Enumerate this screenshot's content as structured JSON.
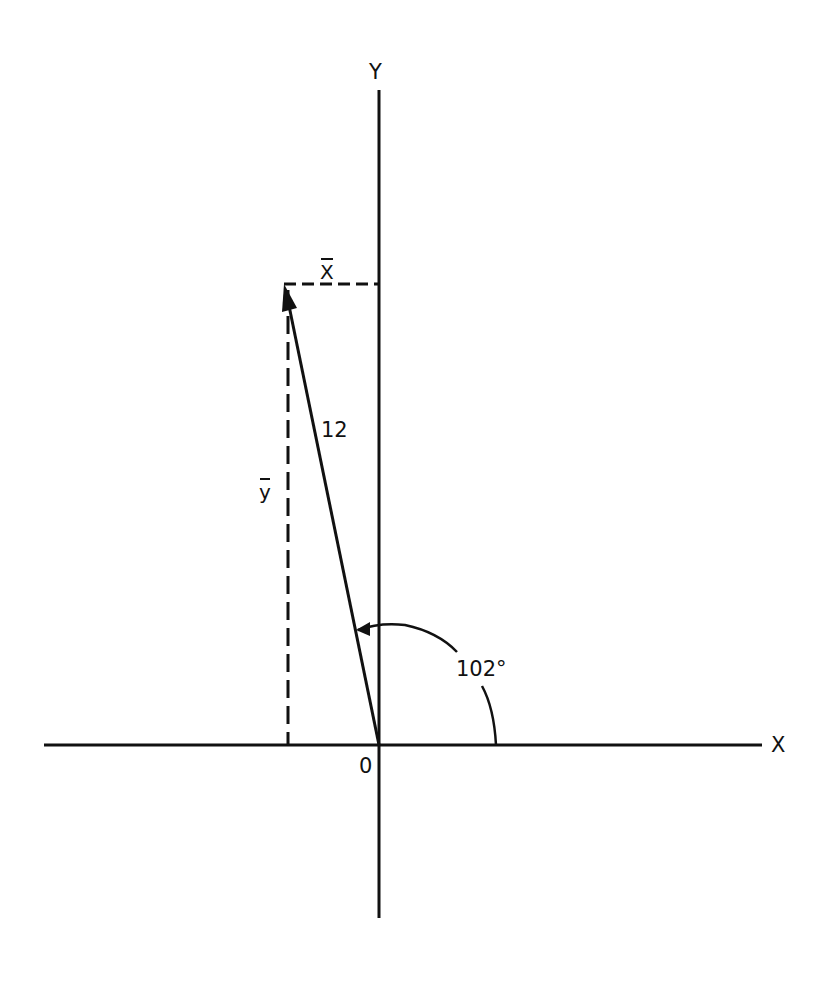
{
  "diagram": {
    "type": "vector-components",
    "axes": {
      "x_label": "X",
      "y_label": "Y",
      "origin_label": "0"
    },
    "vector": {
      "magnitude_label": "12",
      "angle_label": "102°",
      "angle_degrees": 102
    },
    "components": {
      "x_component_label": "X",
      "y_component_label": "y"
    },
    "colors": {
      "ink": "#111111",
      "background": "#ffffff"
    }
  }
}
